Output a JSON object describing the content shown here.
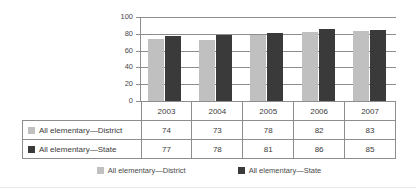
{
  "chart_data": {
    "type": "bar",
    "title": "",
    "xlabel": "",
    "ylabel": "",
    "categories": [
      "2003",
      "2004",
      "2005",
      "2006",
      "2007"
    ],
    "series": [
      {
        "name": "All elementary—District",
        "values": [
          74,
          73,
          78,
          82,
          83
        ],
        "color": "#c0c0c0"
      },
      {
        "name": "All elementary—State",
        "values": [
          77,
          78,
          81,
          86,
          85
        ],
        "color": "#3a3a3a"
      }
    ],
    "ylim": [
      0,
      100
    ],
    "yticks": [
      0,
      20,
      40,
      60,
      80,
      100
    ],
    "grid": true,
    "legend_position": "bottom"
  },
  "table": {
    "corner_label": "",
    "columns": [
      "2003",
      "2004",
      "2005",
      "2006",
      "2007"
    ],
    "rows": [
      {
        "label": "All elementary—District",
        "swatch": "district-swatch",
        "values": [
          "74",
          "73",
          "78",
          "82",
          "83"
        ]
      },
      {
        "label": "All elementary—State",
        "swatch": "state-swatch",
        "values": [
          "77",
          "78",
          "81",
          "86",
          "85"
        ]
      }
    ]
  },
  "legend": {
    "items": [
      {
        "label": "All elementary—District",
        "swatch": "district-swatch"
      },
      {
        "label": "All elementary—State",
        "swatch": "state-swatch"
      }
    ]
  },
  "colors": {
    "district": "#c0c0c0",
    "state": "#3a3a3a",
    "grid": "#8d8d8d",
    "text": "#3b3b3b"
  }
}
